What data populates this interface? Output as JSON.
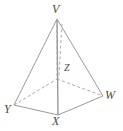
{
  "figure": {
    "name": "square-pyramid-diagram",
    "type": "geometric-solid-diagram",
    "solid": "square pyramid",
    "background_color": "#ffffff",
    "line_color": "#9a9a9a",
    "hidden_line_color": "#a8a8a8",
    "label_color": "#4a4a4a",
    "labels": {
      "apex": "V",
      "base_left": "Y",
      "base_front": "X",
      "base_right": "W",
      "center": "Z"
    },
    "vertices": [
      {
        "id": "V",
        "label": "V",
        "x": 57,
        "y": 19,
        "role": "apex",
        "visible": true
      },
      {
        "id": "Y",
        "label": "Y",
        "x": 14,
        "y": 105,
        "role": "base-left",
        "visible": true
      },
      {
        "id": "X",
        "label": "X",
        "x": 58,
        "y": 115,
        "role": "base-front",
        "visible": true
      },
      {
        "id": "W",
        "label": "W",
        "x": 103,
        "y": 96,
        "role": "base-right",
        "visible": true
      },
      {
        "id": "B",
        "label": "",
        "x": 57,
        "y": 79,
        "role": "base-back-hidden",
        "visible": false
      },
      {
        "id": "Z",
        "label": "Z",
        "x": 58,
        "y": 79,
        "role": "base-center",
        "visible": true
      }
    ],
    "edges": [
      {
        "from": "V",
        "to": "Y",
        "style": "solid",
        "name": "edge-V-Y"
      },
      {
        "from": "V",
        "to": "X",
        "style": "solid",
        "name": "edge-V-X"
      },
      {
        "from": "V",
        "to": "W",
        "style": "solid",
        "name": "edge-V-W"
      },
      {
        "from": "Y",
        "to": "X",
        "style": "solid",
        "name": "edge-Y-X"
      },
      {
        "from": "X",
        "to": "W",
        "style": "solid",
        "name": "edge-X-W"
      },
      {
        "from": "Y",
        "to": "B",
        "style": "dashed",
        "name": "edge-Y-back-hidden"
      },
      {
        "from": "B",
        "to": "W",
        "style": "dashed",
        "name": "edge-back-W-hidden"
      },
      {
        "from": "V",
        "to": "B",
        "style": "dashed",
        "name": "edge-V-back-hidden"
      },
      {
        "from": "Z",
        "to": "X",
        "style": "solid",
        "name": "altitude-Z-X"
      }
    ]
  }
}
